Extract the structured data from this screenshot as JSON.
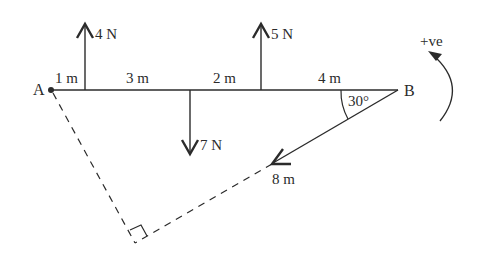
{
  "points": {
    "A": "A",
    "B": "B"
  },
  "segments": [
    {
      "label": "1 m"
    },
    {
      "label": "3 m"
    },
    {
      "label": "2 m"
    },
    {
      "label": "4 m"
    }
  ],
  "forces": [
    {
      "label": "4 N",
      "direction": "up"
    },
    {
      "label": "7 N",
      "direction": "down"
    },
    {
      "label": "5 N",
      "direction": "up"
    },
    {
      "label": "8 m",
      "direction": "diagonal-down-left"
    }
  ],
  "angle": {
    "label": "30°"
  },
  "sign_convention": {
    "label": "+ve",
    "direction": "anticlockwise"
  },
  "colors": {
    "line": "#2b2b2b",
    "background": "#ffffff"
  }
}
